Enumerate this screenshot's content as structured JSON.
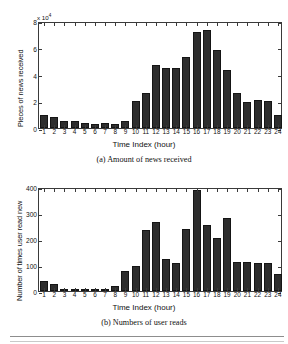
{
  "page": {
    "background": "#ffffff",
    "bar_color": "#2d2d2d",
    "axis_color": "#3a3a3a"
  },
  "figures": [
    {
      "id": "a",
      "caption": "(a)  Amount of news received",
      "exponent_label": "x 10",
      "exponent_power": "4"
    },
    {
      "id": "b",
      "caption": "(b)  Numbers of user reads",
      "exponent_label": "",
      "exponent_power": ""
    }
  ],
  "chart_data": [
    {
      "type": "bar",
      "title": "(a)  Amount of news received",
      "xlabel": "Time Index (hour)",
      "ylabel": "Pieces of news received",
      "y_exponent": "x 10^4",
      "ylim": [
        0,
        80000
      ],
      "yticks": [
        0,
        20000,
        40000,
        60000,
        80000
      ],
      "ytick_labels": [
        "0",
        "2",
        "4",
        "6",
        "8"
      ],
      "grid": false,
      "legend": "none",
      "categories": [
        "1",
        "2",
        "3",
        "4",
        "5",
        "6",
        "7",
        "8",
        "9",
        "10",
        "11",
        "12",
        "13",
        "14",
        "15",
        "16",
        "17",
        "18",
        "19",
        "20",
        "21",
        "22",
        "23",
        "24"
      ],
      "values": [
        9500,
        8200,
        5500,
        5000,
        3500,
        3200,
        3500,
        3000,
        5000,
        20500,
        26000,
        47000,
        45000,
        45000,
        53000,
        72000,
        73500,
        58000,
        43500,
        26000,
        19500,
        21000,
        20500,
        10000
      ]
    },
    {
      "type": "bar",
      "title": "(b)  Numbers of user reads",
      "xlabel": "Time Index (hour)",
      "ylabel": "Number of times user read new",
      "y_exponent": "",
      "ylim": [
        0,
        400
      ],
      "yticks": [
        0,
        100,
        200,
        300,
        400
      ],
      "ytick_labels": [
        "0",
        "100",
        "200",
        "300",
        "400"
      ],
      "grid": false,
      "legend": "none",
      "categories": [
        "1",
        "2",
        "3",
        "4",
        "5",
        "6",
        "7",
        "8",
        "9",
        "10",
        "11",
        "12",
        "13",
        "14",
        "15",
        "16",
        "17",
        "18",
        "19",
        "20",
        "21",
        "22",
        "23",
        "24"
      ],
      "values": [
        38,
        27,
        7,
        6,
        4,
        8,
        2,
        21,
        78,
        97,
        233,
        266,
        124,
        108,
        238,
        387,
        255,
        203,
        281,
        110,
        112,
        108,
        107,
        66
      ]
    }
  ]
}
